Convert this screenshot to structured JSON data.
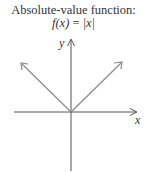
{
  "title": "Absolute-value function:",
  "formula": {
    "lhs": "f(x)",
    "eq": " = ",
    "rhs": "|x|"
  },
  "axes": {
    "x_label": "x",
    "y_label": "y"
  },
  "colors": {
    "text": "#333333",
    "axis": "#555555",
    "graph": "#8a8a8a"
  }
}
